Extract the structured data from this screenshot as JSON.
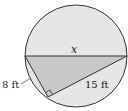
{
  "diagram": {
    "type": "geometry",
    "colors": {
      "circle_fill": "#e6e6e6",
      "triangle_fill": "#c8c8c8",
      "stroke": "#333333"
    },
    "labels": {
      "diameter": "x",
      "short_leg": "8 ft",
      "long_leg": "15 ft"
    },
    "values": {
      "short_leg_ft": 8,
      "long_leg_ft": 15
    }
  }
}
